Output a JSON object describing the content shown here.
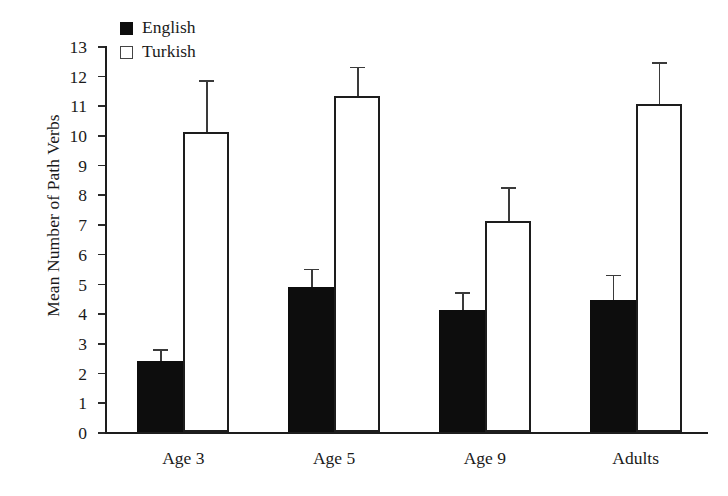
{
  "chart_data": {
    "type": "bar",
    "title": "",
    "xlabel": "",
    "ylabel": "Mean Number of Path Verbs",
    "categories": [
      "Age 3",
      "Age 5",
      "Age 9",
      "Adults"
    ],
    "ylim": [
      0,
      13
    ],
    "ytick_step": 1,
    "ytick_labels": [
      "13",
      "12",
      "11",
      "10",
      "9",
      "8",
      "7",
      "6",
      "5",
      "4",
      "3",
      "2",
      "1",
      "0"
    ],
    "grid": false,
    "legend_position": "top-left",
    "series": [
      {
        "name": "English",
        "color": "#0d0d0d",
        "style": "filled",
        "values": [
          2.4,
          4.9,
          4.1,
          4.45
        ],
        "errors": [
          0.4,
          0.6,
          0.6,
          0.85
        ]
      },
      {
        "name": "Turkish",
        "color": "#ffffff",
        "style": "hollow",
        "values": [
          10.1,
          11.3,
          7.1,
          11.05
        ],
        "errors": [
          1.75,
          1.0,
          1.15,
          1.4
        ]
      }
    ]
  },
  "legend": {
    "items": [
      {
        "label": "English",
        "style": "filled"
      },
      {
        "label": "Turkish",
        "style": "hollow"
      }
    ]
  },
  "axes": {
    "y_title": "Mean Number of Path Verbs"
  }
}
